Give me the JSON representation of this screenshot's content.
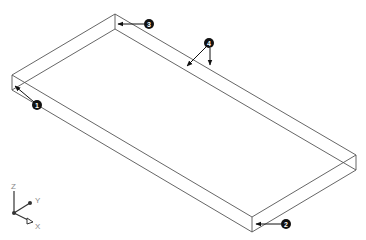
{
  "diagram": {
    "type": "isometric-wireframe-box",
    "colors": {
      "edge": "#555555",
      "callout": "#111111",
      "background": "#ffffff"
    },
    "callouts": [
      {
        "id": "1",
        "label": "1"
      },
      {
        "id": "2",
        "label": "2"
      },
      {
        "id": "3",
        "label": "3"
      },
      {
        "id": "4",
        "label": "4"
      }
    ],
    "axes": {
      "z": "Z",
      "y": "Y",
      "x": "X"
    }
  }
}
